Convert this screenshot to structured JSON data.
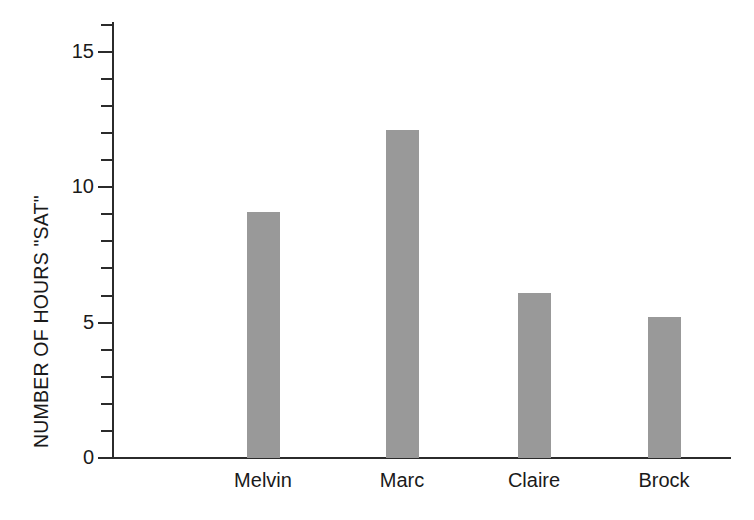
{
  "chart_data": {
    "type": "bar",
    "title": "",
    "subtitle": "",
    "xlabel": "",
    "ylabel": "NUMBER OF HOURS \"SAT\"",
    "categories": [
      "Melvin",
      "Marc",
      "Claire",
      "Brock"
    ],
    "values": [
      9.1,
      12.1,
      6.1,
      5.2
    ],
    "ylim": [
      0,
      16.1
    ],
    "y_major_ticks": [
      0,
      5,
      10,
      15
    ],
    "y_major_tick_labels": [
      "0",
      "5",
      "10",
      "15"
    ],
    "y_minor_tick_interval": 1,
    "grid": false,
    "legend": false,
    "bar_color": "#999999",
    "axis_color": "#2b2b2b",
    "background_color": "#ffffff",
    "annotations": [
      "Brock (9)",
      "Melvin (3) Claire (9)",
      "Melvin (6)",
      "Claire (5)"
    ],
    "annotation_orientation": "vertical",
    "annotation_placement": "left-of-bar"
  }
}
